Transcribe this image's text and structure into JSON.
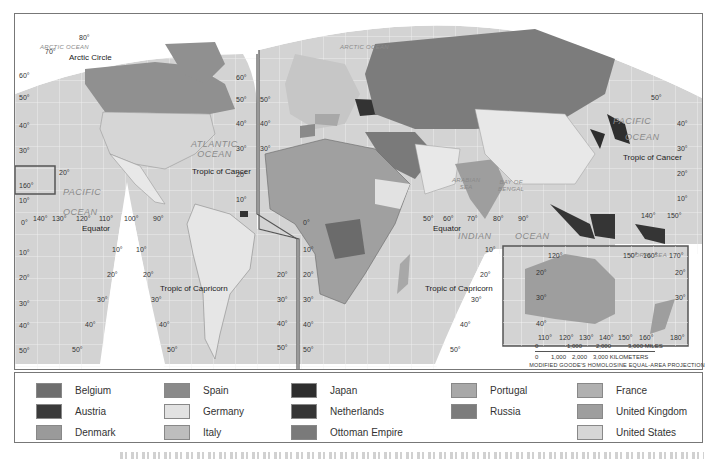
{
  "map": {
    "projection": "MODIFIED GOODE'S HOMOLOSINE EQUAL-AREA PROJECTION",
    "oceans": [
      {
        "id": "arctic-ocean-west",
        "label": "ARCTIC OCEAN"
      },
      {
        "id": "arctic-ocean-east",
        "label": "ARCTIC OCEAN"
      },
      {
        "id": "atlantic-ocean",
        "label": "ATLANTIC\nOCEAN"
      },
      {
        "id": "pacific-ocean-east",
        "label": "PACIFIC"
      },
      {
        "id": "pacific-ocean-east-2",
        "label": "OCEAN"
      },
      {
        "id": "pacific-ocean-west",
        "label": "PACIFIC"
      },
      {
        "id": "pacific-ocean-west-2",
        "label": "OCEAN"
      },
      {
        "id": "indian-ocean",
        "label": "INDIAN"
      },
      {
        "id": "indian-ocean-2",
        "label": "OCEAN"
      },
      {
        "id": "arabian-sea",
        "label": "ARABIAN\nSEA"
      },
      {
        "id": "bay-of-bengal",
        "label": "BAY OF\nBENGAL"
      },
      {
        "id": "coral-sea",
        "label": "CORAL SEA"
      }
    ],
    "features": {
      "arctic_circle": "Arctic Circle",
      "tropic_of_cancer_americas": "Tropic of Cancer",
      "tropic_of_cancer_asia": "Tropic of Cancer",
      "tropic_of_capricorn_americas": "Tropic of Capricorn",
      "tropic_of_capricorn_africa": "Tropic of Capricorn",
      "equator_americas": "Equator",
      "equator_africa": "Equator"
    },
    "lat_labels_americas_left": [
      "80°",
      "70°",
      "60°",
      "50°",
      "40°",
      "30°",
      "10°",
      "0°",
      "10°",
      "20°",
      "30°",
      "40°",
      "50°"
    ],
    "lat_labels_americas_right": [
      "60°",
      "50°",
      "40°",
      "30°",
      "20°",
      "10°",
      "20°",
      "30°",
      "40°",
      "50°"
    ],
    "lat_labels_eurasia_left": [
      "50°",
      "40°",
      "30°",
      "0°",
      "10°",
      "20°",
      "30°",
      "40°",
      "50°"
    ],
    "lat_labels_asia_right": [
      "50°",
      "40°",
      "30°",
      "20°",
      "10°"
    ],
    "lat_labels_africa_right": [
      "10°",
      "20°",
      "30°",
      "40°",
      "50°"
    ],
    "lon_labels_pacific": [
      "140°",
      "130°",
      "120°",
      "110°",
      "100°",
      "90°"
    ],
    "lon_labels_indian": [
      "50°",
      "60°",
      "70°",
      "80°",
      "90°"
    ],
    "lon_labels_asia": [
      "140°",
      "150°"
    ],
    "hawaii_inset": {
      "lat": "20°",
      "lon": "160°"
    },
    "gore_labels": {
      "americas_left": [
        "10°",
        "20°",
        "30°",
        "40°",
        "50°"
      ],
      "americas_right": [
        "10°",
        "20°",
        "30°",
        "40°",
        "50°"
      ]
    },
    "australia_inset": {
      "top_lon": [
        "120°",
        "150°",
        "160°",
        "170°"
      ],
      "bottom_lon": [
        "110°",
        "120°",
        "130°",
        "140°",
        "150°",
        "160°",
        "180°"
      ],
      "left_lat": [
        "20°",
        "30°",
        "40°"
      ],
      "right_lat": [
        "20°",
        "30°"
      ]
    },
    "scale": {
      "miles": [
        "0",
        "1,000",
        "2,000",
        "3,000 MILES"
      ],
      "km": [
        "0",
        "1,000",
        "2,000",
        "3,000 KILOMETERS"
      ]
    }
  },
  "legend": {
    "items": [
      {
        "label": "Belgium",
        "color": "#6e6e6e"
      },
      {
        "label": "Austria",
        "color": "#3a3a3a"
      },
      {
        "label": "Denmark",
        "color": "#9a9a9a"
      },
      {
        "label": "Spain",
        "color": "#8a8a8a"
      },
      {
        "label": "Germany",
        "color": "#e2e2e2"
      },
      {
        "label": "Italy",
        "color": "#bdbdbd"
      },
      {
        "label": "Japan",
        "color": "#2e2e2e"
      },
      {
        "label": "Netherlands",
        "color": "#353535"
      },
      {
        "label": "Ottoman Empire",
        "color": "#7a7a7a"
      },
      {
        "label": "Portugal",
        "color": "#a8a8a8"
      },
      {
        "label": "Russia",
        "color": "#7c7c7c"
      },
      {
        "label": "France",
        "color": "#b0b0b0"
      },
      {
        "label": "United Kingdom",
        "color": "#9e9e9e"
      },
      {
        "label": "United States",
        "color": "#d6d6d6"
      }
    ]
  },
  "colors": {
    "ocean": "#d4d4d4",
    "grid": "#f4f4f4",
    "land_unclaimed": "#e8e8e8",
    "frame": "#777777"
  }
}
